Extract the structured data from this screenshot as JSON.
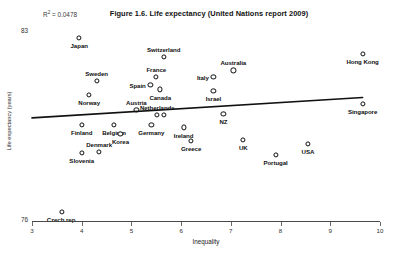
{
  "chart_data": {
    "type": "scatter",
    "title": "Figure 1.6. Life expectancy (United Nations report 2009)",
    "xlabel": "Inequality",
    "ylabel": "Life expectancy (years)",
    "xlim": [
      3,
      10
    ],
    "ylim": [
      76,
      83
    ],
    "xticks": [
      3,
      4,
      5,
      6,
      7,
      8,
      9,
      10
    ],
    "yticks": [
      76,
      83
    ],
    "grid": false,
    "legend": "none",
    "annotations": [
      {
        "name": "r-squared",
        "text": "R² = 0.0478",
        "value": 0.0478
      }
    ],
    "trendline": {
      "type": "linear",
      "x_start": 3.0,
      "y_start": 79.8,
      "x_end": 9.65,
      "y_end": 80.55
    },
    "points": [
      {
        "label": "Japan",
        "x": 3.95,
        "y": 82.75,
        "label_pos": "below"
      },
      {
        "label": "Switzerland",
        "x": 5.65,
        "y": 82.05,
        "label_pos": "above"
      },
      {
        "label": "Hong Kong",
        "x": 9.65,
        "y": 82.15,
        "label_pos": "below"
      },
      {
        "label": "Australia",
        "x": 7.05,
        "y": 81.55,
        "label_pos": "above"
      },
      {
        "label": "Italy",
        "x": 6.65,
        "y": 81.3,
        "label_pos": "left"
      },
      {
        "label": "France",
        "x": 5.5,
        "y": 81.3,
        "label_pos": "above"
      },
      {
        "label": "Sweden",
        "x": 4.3,
        "y": 81.15,
        "label_pos": "above"
      },
      {
        "label": "Spain",
        "x": 5.38,
        "y": 81.0,
        "label_pos": "left"
      },
      {
        "label": "Canada",
        "x": 5.58,
        "y": 80.85,
        "label_pos": "below"
      },
      {
        "label": "Israel",
        "x": 6.65,
        "y": 80.8,
        "label_pos": "below"
      },
      {
        "label": "Norway",
        "x": 4.15,
        "y": 80.65,
        "label_pos": "below"
      },
      {
        "label": "Singapore",
        "x": 9.65,
        "y": 80.3,
        "label_pos": "below"
      },
      {
        "label": "Austria",
        "x": 5.1,
        "y": 80.1,
        "label_pos": "above"
      },
      {
        "label": "Netherlands",
        "x": 5.52,
        "y": 79.9,
        "label_pos": "above"
      },
      {
        "label": "",
        "x": 5.66,
        "y": 79.9,
        "label_pos": "none"
      },
      {
        "label": "NZ",
        "x": 6.85,
        "y": 79.95,
        "label_pos": "below"
      },
      {
        "label": "Germany",
        "x": 5.4,
        "y": 79.55,
        "label_pos": "below"
      },
      {
        "label": "Finland",
        "x": 4.0,
        "y": 79.55,
        "label_pos": "below"
      },
      {
        "label": "Belgium",
        "x": 4.65,
        "y": 79.55,
        "label_pos": "below"
      },
      {
        "label": "Ireland",
        "x": 6.05,
        "y": 79.45,
        "label_pos": "below"
      },
      {
        "label": "Korea",
        "x": 4.78,
        "y": 79.2,
        "label_pos": "below"
      },
      {
        "label": "UK",
        "x": 7.25,
        "y": 79.0,
        "label_pos": "below"
      },
      {
        "label": "Greece",
        "x": 6.2,
        "y": 78.95,
        "label_pos": "below"
      },
      {
        "label": "USA",
        "x": 8.55,
        "y": 78.85,
        "label_pos": "below"
      },
      {
        "label": "Denmark",
        "x": 4.35,
        "y": 78.55,
        "label_pos": "above"
      },
      {
        "label": "Slovenia",
        "x": 4.0,
        "y": 78.5,
        "label_pos": "below"
      },
      {
        "label": "Portugal",
        "x": 7.9,
        "y": 78.45,
        "label_pos": "below"
      },
      {
        "label": "Czech rep.",
        "x": 3.6,
        "y": 76.35,
        "label_pos": "below"
      }
    ]
  },
  "axis": {
    "y_top_tick": "83",
    "y_bottom_tick": "76",
    "x_tick_labels": [
      "3",
      "4",
      "5",
      "6",
      "7",
      "8",
      "9",
      "10"
    ]
  },
  "colors": {
    "marker_stroke": "#0d0d0d",
    "marker_fill": "#ffffff",
    "trendline": "#111111",
    "axis": "#4a4a4a",
    "text": "#0f0f0f"
  }
}
